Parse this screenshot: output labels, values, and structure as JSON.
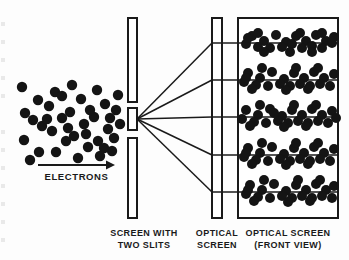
{
  "figure": {
    "background_color": "#fdfdfd",
    "ink_color": "#1a1a1a",
    "dot_color": "#141414",
    "labels": {
      "source_beam": "ELECTRONS",
      "barrier_line1": "SCREEN WITH",
      "barrier_line2": "TWO SLITS",
      "optical_screen_line1": "OPTICAL",
      "optical_screen_line2": "SCREEN",
      "front_view_line1": "OPTICAL SCREEN",
      "front_view_line2": "(FRONT VIEW)"
    },
    "arrow": {
      "x1": 38,
      "y1": 165,
      "x2": 115,
      "y2": 165,
      "label_y": 180
    },
    "barrier": {
      "x": 128,
      "width": 9,
      "segments": [
        {
          "y": 18,
          "height": 84
        },
        {
          "y": 108,
          "height": 22
        },
        {
          "y": 138,
          "height": 80
        }
      ],
      "slits": [
        {
          "y": 102,
          "height": 6
        },
        {
          "y": 130,
          "height": 8
        }
      ]
    },
    "optical_screen": {
      "x": 212,
      "y": 18,
      "width": 10,
      "height": 200
    },
    "front_view_panel": {
      "x": 238,
      "y": 18,
      "width": 100,
      "height": 200
    },
    "band_lines_y": [
      43,
      80,
      117,
      155,
      192
    ],
    "rays": [
      {
        "x1": 137,
        "y1": 119,
        "x2": 212,
        "y2": 43
      },
      {
        "x1": 137,
        "y1": 119,
        "x2": 212,
        "y2": 80
      },
      {
        "x1": 137,
        "y1": 119,
        "x2": 212,
        "y2": 117
      },
      {
        "x1": 137,
        "y1": 119,
        "x2": 212,
        "y2": 155
      },
      {
        "x1": 137,
        "y1": 119,
        "x2": 212,
        "y2": 192
      }
    ],
    "electron_cloud_dots": [
      [
        22,
        87
      ],
      [
        38,
        100
      ],
      [
        25,
        113
      ],
      [
        42,
        126
      ],
      [
        24,
        140
      ],
      [
        39,
        152
      ],
      [
        30,
        160
      ],
      [
        55,
        92
      ],
      [
        49,
        106
      ],
      [
        62,
        118
      ],
      [
        52,
        131
      ],
      [
        66,
        141
      ],
      [
        56,
        152
      ],
      [
        47,
        119
      ],
      [
        72,
        85
      ],
      [
        81,
        99
      ],
      [
        70,
        112
      ],
      [
        84,
        124
      ],
      [
        74,
        136
      ],
      [
        88,
        147
      ],
      [
        78,
        158
      ],
      [
        97,
        90
      ],
      [
        105,
        104
      ],
      [
        94,
        117
      ],
      [
        108,
        129
      ],
      [
        98,
        141
      ],
      [
        112,
        151
      ],
      [
        118,
        95
      ],
      [
        116,
        110
      ],
      [
        120,
        124
      ],
      [
        114,
        138
      ],
      [
        104,
        148
      ],
      [
        86,
        134
      ],
      [
        62,
        96
      ],
      [
        90,
        110
      ],
      [
        110,
        118
      ],
      [
        33,
        120
      ],
      [
        68,
        128
      ],
      [
        100,
        156
      ]
    ],
    "band_dot_rows": [
      {
        "line_y": 43,
        "dots": [
          [
            252,
            36
          ],
          [
            264,
            41
          ],
          [
            276,
            35
          ],
          [
            286,
            42
          ],
          [
            296,
            36
          ],
          [
            306,
            41
          ],
          [
            316,
            35
          ],
          [
            326,
            41
          ],
          [
            246,
            44
          ],
          [
            258,
            47
          ],
          [
            270,
            48
          ],
          [
            282,
            47
          ],
          [
            292,
            44
          ],
          [
            302,
            48
          ],
          [
            312,
            46
          ],
          [
            322,
            48
          ],
          [
            332,
            43
          ],
          [
            258,
            33
          ],
          [
            300,
            33
          ],
          [
            322,
            33
          ],
          [
            264,
            52
          ],
          [
            290,
            52
          ],
          [
            312,
            52
          ],
          [
            248,
            38
          ],
          [
            334,
            37
          ]
        ]
      },
      {
        "line_y": 80,
        "dots": [
          [
            248,
            73
          ],
          [
            260,
            78
          ],
          [
            272,
            72
          ],
          [
            284,
            79
          ],
          [
            294,
            73
          ],
          [
            304,
            78
          ],
          [
            314,
            72
          ],
          [
            324,
            78
          ],
          [
            334,
            74
          ],
          [
            244,
            82
          ],
          [
            256,
            85
          ],
          [
            268,
            86
          ],
          [
            280,
            84
          ],
          [
            290,
            86
          ],
          [
            300,
            84
          ],
          [
            310,
            86
          ],
          [
            320,
            84
          ],
          [
            330,
            86
          ],
          [
            262,
            68
          ],
          [
            296,
            68
          ],
          [
            318,
            68
          ],
          [
            252,
            89
          ],
          [
            286,
            90
          ],
          [
            308,
            89
          ],
          [
            246,
            78
          ]
        ]
      },
      {
        "line_y": 117,
        "dots": [
          [
            246,
            110
          ],
          [
            258,
            115
          ],
          [
            270,
            109
          ],
          [
            282,
            116
          ],
          [
            292,
            110
          ],
          [
            302,
            115
          ],
          [
            312,
            109
          ],
          [
            322,
            115
          ],
          [
            332,
            111
          ],
          [
            242,
            119
          ],
          [
            254,
            122
          ],
          [
            266,
            123
          ],
          [
            278,
            121
          ],
          [
            288,
            123
          ],
          [
            298,
            121
          ],
          [
            308,
            123
          ],
          [
            318,
            121
          ],
          [
            328,
            123
          ],
          [
            260,
            105
          ],
          [
            294,
            105
          ],
          [
            316,
            105
          ],
          [
            250,
            126
          ],
          [
            284,
            127
          ],
          [
            306,
            126
          ],
          [
            336,
            118
          ],
          [
            274,
            113
          ]
        ]
      },
      {
        "line_y": 155,
        "dots": [
          [
            248,
            148
          ],
          [
            260,
            153
          ],
          [
            272,
            147
          ],
          [
            284,
            154
          ],
          [
            294,
            148
          ],
          [
            304,
            153
          ],
          [
            314,
            147
          ],
          [
            324,
            153
          ],
          [
            334,
            149
          ],
          [
            244,
            157
          ],
          [
            256,
            160
          ],
          [
            268,
            161
          ],
          [
            280,
            159
          ],
          [
            290,
            161
          ],
          [
            300,
            159
          ],
          [
            310,
            161
          ],
          [
            320,
            159
          ],
          [
            330,
            161
          ],
          [
            262,
            143
          ],
          [
            296,
            143
          ],
          [
            318,
            143
          ],
          [
            252,
            164
          ],
          [
            286,
            165
          ],
          [
            308,
            164
          ],
          [
            246,
            153
          ]
        ]
      },
      {
        "line_y": 192,
        "dots": [
          [
            250,
            185
          ],
          [
            262,
            190
          ],
          [
            274,
            184
          ],
          [
            286,
            191
          ],
          [
            296,
            185
          ],
          [
            306,
            190
          ],
          [
            316,
            184
          ],
          [
            326,
            190
          ],
          [
            334,
            186
          ],
          [
            246,
            194
          ],
          [
            258,
            197
          ],
          [
            270,
            198
          ],
          [
            282,
            196
          ],
          [
            292,
            198
          ],
          [
            302,
            196
          ],
          [
            312,
            198
          ],
          [
            322,
            196
          ],
          [
            332,
            198
          ],
          [
            264,
            180
          ],
          [
            298,
            180
          ],
          [
            320,
            180
          ],
          [
            254,
            201
          ],
          [
            288,
            202
          ],
          [
            310,
            201
          ],
          [
            248,
            190
          ]
        ]
      }
    ],
    "dot_radius": 5.2,
    "band_dot_radius": 5.0,
    "edge_artifacts_y": [
      22,
      40,
      58,
      76,
      94,
      130,
      148,
      166,
      184,
      202,
      220,
      238
    ]
  }
}
